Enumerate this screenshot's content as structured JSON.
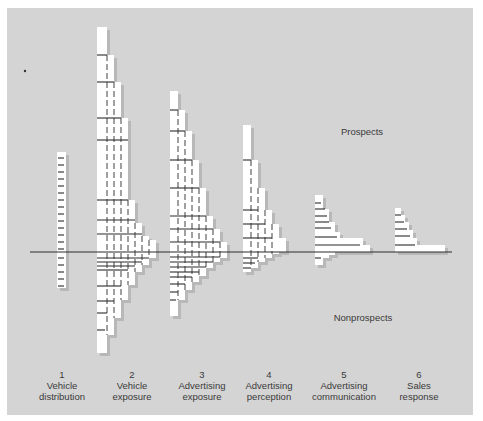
{
  "title": "",
  "labels": {
    "prospects": "Prospects",
    "nonprospects": "Nonprospects"
  },
  "stages": [
    {
      "number": "1",
      "line1": "Vehicle",
      "line2": "distribution",
      "cx": 62
    },
    {
      "number": "2",
      "line1": "Vehicle",
      "line2": "exposure",
      "cx": 126
    },
    {
      "number": "3",
      "line1": "Advertising",
      "line2": "exposure",
      "cx": 200
    },
    {
      "number": "4",
      "line1": "Advertising",
      "line2": "perception",
      "cx": 268
    },
    {
      "number": "5",
      "line1": "Advertising",
      "line2": "communication",
      "cx": 344
    },
    {
      "number": "6",
      "line1": "Sales",
      "line2": "response",
      "cx": 418
    }
  ],
  "colors": {
    "panel": "#d4d4d4",
    "bar": "#ffffff",
    "shadow": "#b8b8b8",
    "line": "#2a2a2a",
    "text": "#3a3a3a"
  },
  "chart_data": {
    "type": "bar",
    "baseline_y": 252,
    "categories": [
      "Vehicle distribution",
      "Vehicle exposure",
      "Advertising exposure",
      "Advertising perception",
      "Advertising communication",
      "Sales response"
    ],
    "series": [
      {
        "name": "Vehicle distribution",
        "steps": [
          {
            "x": 57,
            "w": 9,
            "top": 152,
            "bottom": 288
          }
        ],
        "ticks_above": [
          158,
          165,
          172,
          179,
          186,
          193,
          200,
          207,
          214,
          221,
          228,
          235,
          242,
          249
        ],
        "ticks_below": [
          258,
          265,
          272,
          279,
          286
        ],
        "dashes": []
      },
      {
        "name": "Vehicle exposure",
        "steps": [
          {
            "x": 97,
            "w": 10,
            "top": 27,
            "bottom": 353
          },
          {
            "x": 97,
            "w": 17,
            "top": 55,
            "bottom": 335
          },
          {
            "x": 97,
            "w": 24,
            "top": 82,
            "bottom": 318
          },
          {
            "x": 97,
            "w": 31,
            "top": 118,
            "bottom": 300
          },
          {
            "x": 97,
            "w": 38,
            "top": 200,
            "bottom": 285
          },
          {
            "x": 97,
            "w": 45,
            "top": 223,
            "bottom": 272
          },
          {
            "x": 97,
            "w": 52,
            "top": 236,
            "bottom": 265
          },
          {
            "x": 97,
            "w": 59,
            "top": 240,
            "bottom": 258
          }
        ],
        "ticks_above": [
          {
            "y": 55,
            "w": 10
          },
          {
            "y": 82,
            "w": 17
          },
          {
            "y": 118,
            "w": 24
          },
          {
            "y": 140,
            "w": 31
          },
          {
            "y": 200,
            "w": 31
          },
          {
            "y": 220,
            "w": 38
          },
          {
            "y": 234,
            "w": 45
          }
        ],
        "ticks_below": [
          {
            "y": 258,
            "w": 52
          },
          {
            "y": 262,
            "w": 45
          },
          {
            "y": 266,
            "w": 38
          },
          {
            "y": 270,
            "w": 31
          },
          {
            "y": 286,
            "w": 24
          },
          {
            "y": 301,
            "w": 17
          },
          {
            "y": 313,
            "w": 10
          },
          {
            "y": 330,
            "w": 8
          }
        ],
        "dashes": [
          107,
          114,
          121,
          128,
          135,
          142,
          149
        ]
      },
      {
        "name": "Advertising exposure",
        "steps": [
          {
            "x": 170,
            "w": 8,
            "top": 91,
            "bottom": 316
          },
          {
            "x": 170,
            "w": 15,
            "top": 110,
            "bottom": 300
          },
          {
            "x": 170,
            "w": 22,
            "top": 131,
            "bottom": 290
          },
          {
            "x": 170,
            "w": 29,
            "top": 160,
            "bottom": 282
          },
          {
            "x": 170,
            "w": 36,
            "top": 188,
            "bottom": 276
          },
          {
            "x": 170,
            "w": 43,
            "top": 216,
            "bottom": 268
          },
          {
            "x": 170,
            "w": 50,
            "top": 229,
            "bottom": 262
          },
          {
            "x": 170,
            "w": 57,
            "top": 242,
            "bottom": 258
          }
        ],
        "ticks_above": [
          {
            "y": 110,
            "w": 8
          },
          {
            "y": 131,
            "w": 15
          },
          {
            "y": 160,
            "w": 22
          },
          {
            "y": 188,
            "w": 29
          },
          {
            "y": 216,
            "w": 36
          },
          {
            "y": 229,
            "w": 43
          },
          {
            "y": 242,
            "w": 50
          }
        ],
        "ticks_below": [
          {
            "y": 257,
            "w": 50
          },
          {
            "y": 262,
            "w": 43
          },
          {
            "y": 267,
            "w": 36
          },
          {
            "y": 272,
            "w": 29
          },
          {
            "y": 277,
            "w": 22
          },
          {
            "y": 284,
            "w": 15
          },
          {
            "y": 292,
            "w": 8
          },
          {
            "y": 300,
            "w": 6
          }
        ],
        "dashes": [
          178,
          185,
          192,
          199,
          206,
          213,
          220
        ]
      },
      {
        "name": "Advertising perception",
        "steps": [
          {
            "x": 243,
            "w": 8,
            "top": 125,
            "bottom": 272
          },
          {
            "x": 243,
            "w": 15,
            "top": 160,
            "bottom": 268
          },
          {
            "x": 243,
            "w": 22,
            "top": 188,
            "bottom": 262
          },
          {
            "x": 243,
            "w": 29,
            "top": 210,
            "bottom": 258
          },
          {
            "x": 243,
            "w": 36,
            "top": 224,
            "bottom": 254
          },
          {
            "x": 243,
            "w": 43,
            "top": 238,
            "bottom": 252
          }
        ],
        "ticks_above": [
          {
            "y": 160,
            "w": 8
          },
          {
            "y": 210,
            "w": 15
          },
          {
            "y": 224,
            "w": 22
          },
          {
            "y": 238,
            "w": 29
          }
        ],
        "ticks_below": [
          {
            "y": 258,
            "w": 15
          },
          {
            "y": 263,
            "w": 12
          },
          {
            "y": 268,
            "w": 8
          }
        ],
        "dashes": [
          251,
          258,
          265,
          272
        ]
      },
      {
        "name": "Advertising communication",
        "steps": [
          {
            "x": 315,
            "w": 8,
            "top": 195,
            "bottom": 265
          },
          {
            "x": 315,
            "w": 14,
            "top": 209,
            "bottom": 258
          },
          {
            "x": 315,
            "w": 20,
            "top": 222,
            "bottom": 255
          },
          {
            "x": 315,
            "w": 25,
            "top": 232,
            "bottom": 252
          },
          {
            "x": 315,
            "w": 48,
            "top": 238,
            "bottom": 252
          },
          {
            "x": 315,
            "w": 55,
            "top": 245,
            "bottom": 252
          }
        ],
        "ticks_above": [
          {
            "y": 203,
            "w": 6
          },
          {
            "y": 209,
            "w": 10
          },
          {
            "y": 216,
            "w": 12
          },
          {
            "y": 222,
            "w": 14
          },
          {
            "y": 228,
            "w": 16
          },
          {
            "y": 237,
            "w": 22
          },
          {
            "y": 245,
            "w": 45
          }
        ],
        "ticks_below": [
          {
            "y": 258,
            "w": 6
          }
        ],
        "dashes": []
      },
      {
        "name": "Sales response",
        "steps": [
          {
            "x": 395,
            "w": 6,
            "top": 208,
            "bottom": 252
          },
          {
            "x": 395,
            "w": 10,
            "top": 215,
            "bottom": 252
          },
          {
            "x": 395,
            "w": 14,
            "top": 222,
            "bottom": 252
          },
          {
            "x": 395,
            "w": 18,
            "top": 230,
            "bottom": 252
          },
          {
            "x": 395,
            "w": 22,
            "top": 238,
            "bottom": 252
          },
          {
            "x": 395,
            "w": 50,
            "top": 245,
            "bottom": 252
          }
        ],
        "ticks_above": [
          {
            "y": 215,
            "w": 6
          },
          {
            "y": 222,
            "w": 9
          },
          {
            "y": 229,
            "w": 12
          },
          {
            "y": 236,
            "w": 15
          },
          {
            "y": 245,
            "w": 20
          }
        ],
        "ticks_below": [],
        "dashes": []
      }
    ]
  }
}
